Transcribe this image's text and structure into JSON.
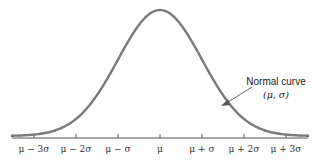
{
  "chart_data": {
    "type": "line",
    "title": "",
    "xlabel": "",
    "ylabel": "",
    "x_tick_labels": [
      "μ − 3σ",
      "μ − 2σ",
      "μ − σ",
      "μ",
      "μ + σ",
      "μ + 2σ",
      "μ + 3σ"
    ],
    "x_ticks_sigma": [
      -3,
      -2,
      -1,
      0,
      1,
      2,
      3
    ],
    "series": [
      {
        "name": "Normal curve (μ, σ)",
        "function": "normal_pdf",
        "mean": 0,
        "sd": 1,
        "x_range": [
          -3.5,
          3.5
        ]
      }
    ],
    "annotations": [
      {
        "text": "Normal curve",
        "subtext": "(μ, σ)",
        "arrow_to_x_sigma": 1.4
      }
    ],
    "grid": false,
    "legend": "none",
    "colors": {
      "curve": "#7a7a7a",
      "axis": "#555555",
      "arrow": "#555555"
    }
  },
  "labels": {
    "ticks": [
      "μ − 3σ",
      "μ − 2σ",
      "μ − σ",
      "μ",
      "μ + σ",
      "μ + 2σ",
      "μ + 3σ"
    ],
    "annotation_line1": "Normal curve",
    "annotation_line2": "(μ, σ)"
  }
}
